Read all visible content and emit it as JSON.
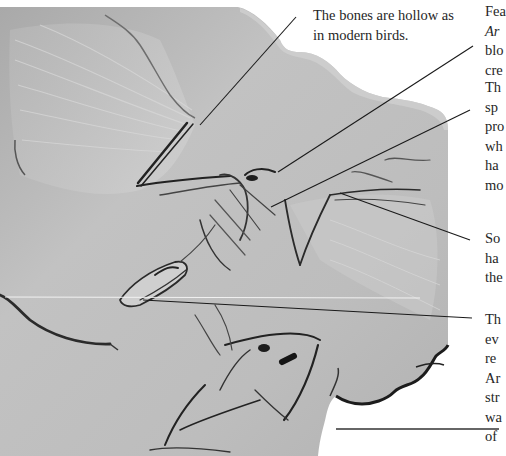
{
  "figure": {
    "colors": {
      "slab": "#b9b9b9",
      "slab_light": "#d6d6d6",
      "slab_dark": "#8e8e8e",
      "bone_shadow": "#2a2a2a",
      "leader_line": "#1a1a1a",
      "background": "#ffffff"
    }
  },
  "captions": {
    "bones": {
      "lines": [
        "The bones are hollow as",
        "in modern birds."
      ]
    },
    "feathers": {
      "lines": [
        "Fea",
        "Ar",
        "blo",
        "cre"
      ],
      "italic_line_index": 1
    },
    "specimen": {
      "lines": [
        "Th",
        "sp",
        "pro",
        "wh",
        "ha",
        "mo"
      ]
    },
    "some": {
      "lines": [
        "So",
        "ha",
        "the"
      ]
    },
    "the": {
      "lines": [
        "Th",
        "ev",
        "re",
        "Ar",
        "str",
        "wa",
        "of"
      ]
    }
  },
  "leader_lines": [
    {
      "name": "bones",
      "x1": 296,
      "y1": 17,
      "x2": 200,
      "y2": 125
    },
    {
      "name": "feathers",
      "x1": 473,
      "y1": 46,
      "x2": 278,
      "y2": 172
    },
    {
      "name": "specimen",
      "x1": 470,
      "y1": 110,
      "x2": 271,
      "y2": 207
    },
    {
      "name": "some",
      "x1": 470,
      "y1": 240,
      "x2": 340,
      "y2": 193
    },
    {
      "name": "the",
      "x1": 472,
      "y1": 318,
      "x2": 143,
      "y2": 300
    },
    {
      "name": "rule",
      "x1": 336,
      "y1": 429,
      "x2": 499,
      "y2": 429
    }
  ]
}
